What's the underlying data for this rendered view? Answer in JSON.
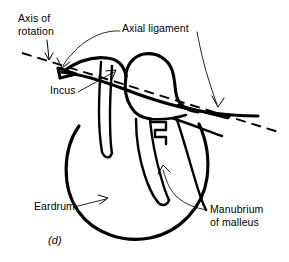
{
  "figure": {
    "panel_label": "(d)",
    "background_color": "#ffffff",
    "ink_color": "#000000"
  },
  "labels": {
    "axis_of_rotation": "Axis of\nrotation",
    "axial_ligament": "Axial ligament",
    "incus": "Incus",
    "eardrum": "Eardrum",
    "manubrium_of_malleus": "Manubrium\nof malleus"
  },
  "annotations": [
    {
      "name": "axis-of-rotation",
      "text": "Axis of rotation",
      "leader_type": "straight-arrow",
      "points_to": "dashed axis line"
    },
    {
      "name": "axial-ligament",
      "text": "Axial ligament",
      "leader_type": "curved-arrow",
      "points_to": "ligament attachment at axis"
    },
    {
      "name": "incus",
      "text": "Incus",
      "leader_type": "straight-arrow",
      "points_to": "incus body"
    },
    {
      "name": "eardrum",
      "text": "Eardrum",
      "leader_type": "straight-arrow",
      "points_to": "tympanic membrane outline"
    },
    {
      "name": "manubrium-of-malleus",
      "text": "Manubrium of malleus",
      "leader_type": "curved-arrow",
      "points_to": "manubrium tip"
    }
  ]
}
